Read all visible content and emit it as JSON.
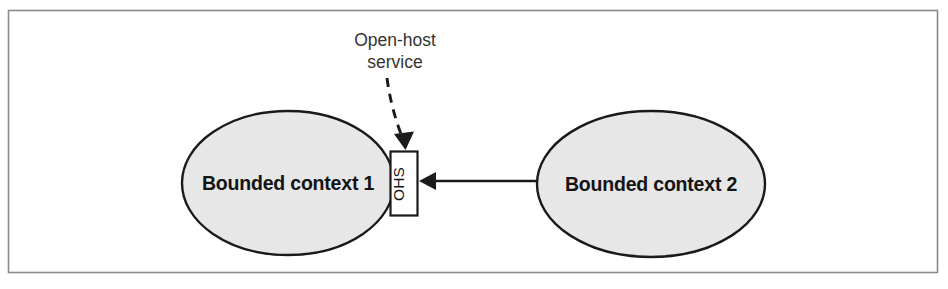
{
  "figure": {
    "name": "open-host-service-diagram",
    "background_color": "#ffffff",
    "border_color": "#8a8a8a"
  },
  "annotation": {
    "line1": "Open-host",
    "line2": "service",
    "icon": "dashed-leader-arrow-icon",
    "text_color": "#343434"
  },
  "contexts": [
    {
      "label": "Bounded context 1",
      "fill_color": "#e7e7e7",
      "stroke_color": "#1a1a1a"
    },
    {
      "label": "Bounded context 2",
      "fill_color": "#e7e7e7",
      "stroke_color": "#1a1a1a"
    }
  ],
  "ohs_port": {
    "label": "OHS",
    "fill_color": "#ffffff",
    "stroke_color": "#1a1a1a"
  },
  "relationship": {
    "icon": "left-arrow-icon",
    "stroke_color": "#1a1a1a"
  }
}
